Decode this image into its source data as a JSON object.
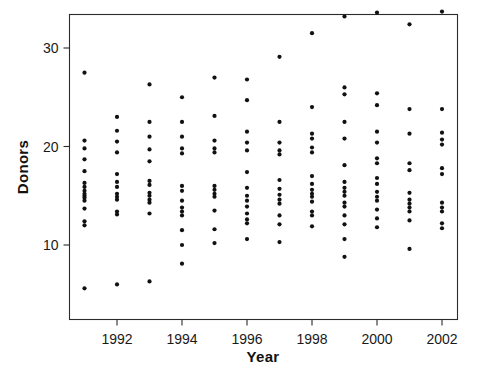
{
  "chart_data": {
    "type": "scatter",
    "title": "",
    "xlabel": "Year",
    "ylabel": "Donors",
    "xlim": [
      1990.4,
      2002.6
    ],
    "ylim": [
      4.2,
      34.6
    ],
    "grid": false,
    "legend": null,
    "x_ticks": [
      1992,
      1994,
      1996,
      1998,
      2000,
      2002
    ],
    "x_tick_labels": [
      "1992",
      "1994",
      "1996",
      "1998",
      "2000",
      "2002"
    ],
    "y_ticks": [
      10,
      20,
      30
    ],
    "y_tick_labels": [
      "10",
      "20",
      "30"
    ],
    "point_color": "#111111",
    "point_marker": "circle",
    "series": [
      {
        "name": "Donors per million population by year",
        "points": [
          {
            "x": 1991,
            "y": 27.5
          },
          {
            "x": 1991,
            "y": 20.6
          },
          {
            "x": 1991,
            "y": 19.8
          },
          {
            "x": 1991,
            "y": 18.7
          },
          {
            "x": 1991,
            "y": 17.5
          },
          {
            "x": 1991,
            "y": 16.3
          },
          {
            "x": 1991,
            "y": 15.9
          },
          {
            "x": 1991,
            "y": 15.5
          },
          {
            "x": 1991,
            "y": 15.2
          },
          {
            "x": 1991,
            "y": 15.0
          },
          {
            "x": 1991,
            "y": 14.8
          },
          {
            "x": 1991,
            "y": 14.5
          },
          {
            "x": 1991,
            "y": 13.7
          },
          {
            "x": 1991,
            "y": 12.4
          },
          {
            "x": 1991,
            "y": 12.0
          },
          {
            "x": 1991,
            "y": 5.6
          },
          {
            "x": 1992,
            "y": 23.0
          },
          {
            "x": 1992,
            "y": 21.6
          },
          {
            "x": 1992,
            "y": 20.5
          },
          {
            "x": 1992,
            "y": 19.4
          },
          {
            "x": 1992,
            "y": 17.2
          },
          {
            "x": 1992,
            "y": 16.4
          },
          {
            "x": 1992,
            "y": 15.9
          },
          {
            "x": 1992,
            "y": 15.2
          },
          {
            "x": 1992,
            "y": 14.9
          },
          {
            "x": 1992,
            "y": 14.6
          },
          {
            "x": 1992,
            "y": 13.4
          },
          {
            "x": 1992,
            "y": 13.1
          },
          {
            "x": 1992,
            "y": 6.0
          },
          {
            "x": 1993,
            "y": 26.3
          },
          {
            "x": 1993,
            "y": 22.5
          },
          {
            "x": 1993,
            "y": 21.0
          },
          {
            "x": 1993,
            "y": 19.7
          },
          {
            "x": 1993,
            "y": 18.5
          },
          {
            "x": 1993,
            "y": 16.5
          },
          {
            "x": 1993,
            "y": 16.1
          },
          {
            "x": 1993,
            "y": 15.3
          },
          {
            "x": 1993,
            "y": 15.0
          },
          {
            "x": 1993,
            "y": 14.6
          },
          {
            "x": 1993,
            "y": 14.3
          },
          {
            "x": 1993,
            "y": 13.2
          },
          {
            "x": 1993,
            "y": 6.3
          },
          {
            "x": 1994,
            "y": 25.0
          },
          {
            "x": 1994,
            "y": 22.5
          },
          {
            "x": 1994,
            "y": 21.0
          },
          {
            "x": 1994,
            "y": 19.8
          },
          {
            "x": 1994,
            "y": 19.3
          },
          {
            "x": 1994,
            "y": 16.0
          },
          {
            "x": 1994,
            "y": 15.5
          },
          {
            "x": 1994,
            "y": 14.5
          },
          {
            "x": 1994,
            "y": 13.8
          },
          {
            "x": 1994,
            "y": 13.4
          },
          {
            "x": 1994,
            "y": 13.0
          },
          {
            "x": 1994,
            "y": 11.5
          },
          {
            "x": 1994,
            "y": 10.0
          },
          {
            "x": 1994,
            "y": 8.1
          },
          {
            "x": 1995,
            "y": 27.0
          },
          {
            "x": 1995,
            "y": 23.1
          },
          {
            "x": 1995,
            "y": 20.6
          },
          {
            "x": 1995,
            "y": 19.8
          },
          {
            "x": 1995,
            "y": 19.4
          },
          {
            "x": 1995,
            "y": 16.0
          },
          {
            "x": 1995,
            "y": 15.6
          },
          {
            "x": 1995,
            "y": 15.2
          },
          {
            "x": 1995,
            "y": 14.9
          },
          {
            "x": 1995,
            "y": 13.5
          },
          {
            "x": 1995,
            "y": 11.6
          },
          {
            "x": 1995,
            "y": 10.2
          },
          {
            "x": 1996,
            "y": 26.8
          },
          {
            "x": 1996,
            "y": 24.7
          },
          {
            "x": 1996,
            "y": 21.5
          },
          {
            "x": 1996,
            "y": 20.4
          },
          {
            "x": 1996,
            "y": 19.6
          },
          {
            "x": 1996,
            "y": 17.4
          },
          {
            "x": 1996,
            "y": 15.8
          },
          {
            "x": 1996,
            "y": 15.0
          },
          {
            "x": 1996,
            "y": 14.5
          },
          {
            "x": 1996,
            "y": 13.9
          },
          {
            "x": 1996,
            "y": 13.2
          },
          {
            "x": 1996,
            "y": 12.6
          },
          {
            "x": 1996,
            "y": 12.2
          },
          {
            "x": 1996,
            "y": 10.6
          },
          {
            "x": 1997,
            "y": 29.1
          },
          {
            "x": 1997,
            "y": 22.5
          },
          {
            "x": 1997,
            "y": 20.4
          },
          {
            "x": 1997,
            "y": 19.6
          },
          {
            "x": 1997,
            "y": 19.2
          },
          {
            "x": 1997,
            "y": 16.6
          },
          {
            "x": 1997,
            "y": 15.7
          },
          {
            "x": 1997,
            "y": 15.1
          },
          {
            "x": 1997,
            "y": 14.6
          },
          {
            "x": 1997,
            "y": 14.2
          },
          {
            "x": 1997,
            "y": 13.0
          },
          {
            "x": 1997,
            "y": 12.1
          },
          {
            "x": 1997,
            "y": 10.3
          },
          {
            "x": 1998,
            "y": 31.5
          },
          {
            "x": 1998,
            "y": 24.0
          },
          {
            "x": 1998,
            "y": 21.3
          },
          {
            "x": 1998,
            "y": 20.8
          },
          {
            "x": 1998,
            "y": 19.9
          },
          {
            "x": 1998,
            "y": 19.4
          },
          {
            "x": 1998,
            "y": 17.0
          },
          {
            "x": 1998,
            "y": 16.2
          },
          {
            "x": 1998,
            "y": 15.6
          },
          {
            "x": 1998,
            "y": 15.2
          },
          {
            "x": 1998,
            "y": 14.9
          },
          {
            "x": 1998,
            "y": 14.4
          },
          {
            "x": 1998,
            "y": 13.4
          },
          {
            "x": 1998,
            "y": 13.0
          },
          {
            "x": 1998,
            "y": 11.9
          },
          {
            "x": 1999,
            "y": 33.2
          },
          {
            "x": 1999,
            "y": 26.0
          },
          {
            "x": 1999,
            "y": 25.3
          },
          {
            "x": 1999,
            "y": 22.5
          },
          {
            "x": 1999,
            "y": 20.8
          },
          {
            "x": 1999,
            "y": 18.1
          },
          {
            "x": 1999,
            "y": 16.4
          },
          {
            "x": 1999,
            "y": 15.8
          },
          {
            "x": 1999,
            "y": 15.4
          },
          {
            "x": 1999,
            "y": 15.0
          },
          {
            "x": 1999,
            "y": 14.3
          },
          {
            "x": 1999,
            "y": 13.9
          },
          {
            "x": 1999,
            "y": 13.0
          },
          {
            "x": 1999,
            "y": 12.1
          },
          {
            "x": 1999,
            "y": 10.6
          },
          {
            "x": 1999,
            "y": 8.8
          },
          {
            "x": 2000,
            "y": 33.6
          },
          {
            "x": 2000,
            "y": 25.4
          },
          {
            "x": 2000,
            "y": 24.2
          },
          {
            "x": 2000,
            "y": 21.5
          },
          {
            "x": 2000,
            "y": 20.4
          },
          {
            "x": 2000,
            "y": 18.8
          },
          {
            "x": 2000,
            "y": 18.3
          },
          {
            "x": 2000,
            "y": 16.8
          },
          {
            "x": 2000,
            "y": 16.2
          },
          {
            "x": 2000,
            "y": 15.4
          },
          {
            "x": 2000,
            "y": 14.9
          },
          {
            "x": 2000,
            "y": 14.5
          },
          {
            "x": 2000,
            "y": 13.6
          },
          {
            "x": 2000,
            "y": 12.7
          },
          {
            "x": 2000,
            "y": 11.8
          },
          {
            "x": 2001,
            "y": 32.4
          },
          {
            "x": 2001,
            "y": 23.8
          },
          {
            "x": 2001,
            "y": 21.3
          },
          {
            "x": 2001,
            "y": 18.3
          },
          {
            "x": 2001,
            "y": 17.6
          },
          {
            "x": 2001,
            "y": 15.3
          },
          {
            "x": 2001,
            "y": 14.6
          },
          {
            "x": 2001,
            "y": 14.2
          },
          {
            "x": 2001,
            "y": 13.8
          },
          {
            "x": 2001,
            "y": 13.4
          },
          {
            "x": 2001,
            "y": 12.5
          },
          {
            "x": 2001,
            "y": 9.6
          },
          {
            "x": 2002,
            "y": 33.7
          },
          {
            "x": 2002,
            "y": 23.8
          },
          {
            "x": 2002,
            "y": 21.4
          },
          {
            "x": 2002,
            "y": 20.7
          },
          {
            "x": 2002,
            "y": 20.2
          },
          {
            "x": 2002,
            "y": 17.8
          },
          {
            "x": 2002,
            "y": 17.2
          },
          {
            "x": 2002,
            "y": 14.3
          },
          {
            "x": 2002,
            "y": 13.8
          },
          {
            "x": 2002,
            "y": 13.4
          },
          {
            "x": 2002,
            "y": 12.2
          },
          {
            "x": 2002,
            "y": 11.7
          }
        ]
      }
    ]
  }
}
